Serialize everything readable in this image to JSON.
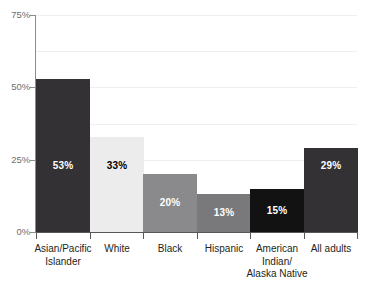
{
  "chart_data": {
    "type": "bar",
    "title": "",
    "subtitle": "",
    "xlabel": "",
    "ylabel": "",
    "ylim": [
      0,
      75
    ],
    "yunit": "%",
    "grid": true,
    "legend": "none",
    "categories": [
      "Asian/Pacific Islander",
      "White",
      "Black",
      "Hispanic",
      "American Indian/ Alaska Native",
      "All adults"
    ],
    "category_lines": [
      [
        "Asian/Pacific",
        "Islander"
      ],
      [
        "White"
      ],
      [
        "Black"
      ],
      [
        "Hispanic"
      ],
      [
        "American",
        "Indian/",
        "Alaska Native"
      ],
      [
        "All adults"
      ]
    ],
    "values": [
      53,
      33,
      20,
      13,
      15,
      29
    ],
    "value_labels": [
      "53%",
      "33%",
      "20%",
      "13%",
      "15%",
      "29%"
    ],
    "bar_colors": [
      "#333133",
      "#ececec",
      "#8a8a8c",
      "#79797b",
      "#121212",
      "#333133"
    ],
    "label_colors": [
      "#ffffff",
      "#000000",
      "#ffffff",
      "#ffffff",
      "#ffffff",
      "#ffffff"
    ],
    "y_ticks": [
      0,
      25,
      50,
      75
    ],
    "y_tick_labels": [
      "0%",
      "25%",
      "50%",
      "75%"
    ],
    "gridline_values": [
      12.5,
      25,
      37.5,
      50,
      62.5,
      75
    ],
    "axis_color": "#58585a",
    "grid_color": "#efeff0"
  }
}
